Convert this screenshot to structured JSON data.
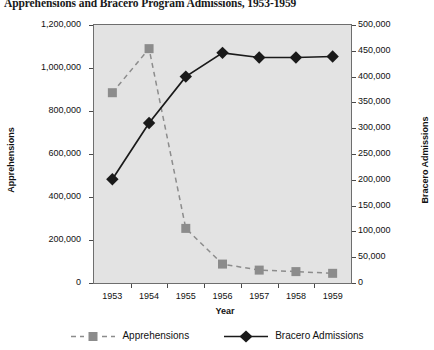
{
  "chart_data": {
    "type": "line",
    "title": "Apprehensions and Bracero Program Admissions, 1953-1959",
    "xlabel": "Year",
    "ylabel": "Apprehensions",
    "ylabel_right": "Bracero Admissions",
    "categories": [
      "1953",
      "1954",
      "1955",
      "1956",
      "1957",
      "1958",
      "1959"
    ],
    "x": [
      1953,
      1954,
      1955,
      1956,
      1957,
      1958,
      1959
    ],
    "ylim": [
      0,
      1200000
    ],
    "ylim_right": [
      0,
      500000
    ],
    "grid": false,
    "legend_position": "bottom",
    "series": [
      {
        "name": "Apprehensions",
        "axis": "left",
        "marker": "square",
        "linestyle": "dashed",
        "color": "#8c8c8c",
        "values": [
          885000,
          1090000,
          254000,
          88000,
          60000,
          53000,
          45000
        ]
      },
      {
        "name": "Bracero Admissions",
        "axis": "right",
        "marker": "diamond",
        "linestyle": "solid",
        "color": "#1a1a1a",
        "values": [
          201000,
          310000,
          400000,
          446000,
          437000,
          437000,
          439000
        ]
      }
    ],
    "yticks_left": [
      "0",
      "200,000",
      "400,000",
      "600,000",
      "800,000",
      "1,000,000",
      "1,200,000"
    ],
    "yticks_left_values": [
      0,
      200000,
      400000,
      600000,
      800000,
      1000000,
      1200000
    ],
    "yticks_right": [
      "0",
      "50,000",
      "100,000",
      "150,000",
      "200,000",
      "250,000",
      "300,000",
      "350,000",
      "400,000",
      "450,000",
      "500,000"
    ],
    "yticks_right_values": [
      0,
      50000,
      100000,
      150000,
      200000,
      250000,
      300000,
      350000,
      400000,
      450000,
      500000
    ]
  },
  "legend": {
    "items": [
      {
        "label": "Apprehensions"
      },
      {
        "label": "Bracero Admissions"
      }
    ]
  },
  "colors": {
    "apprehensions": "#8c8c8c",
    "bracero": "#1a1a1a",
    "plot_background": "#e3e3e3",
    "axis": "#6e6e6e"
  }
}
